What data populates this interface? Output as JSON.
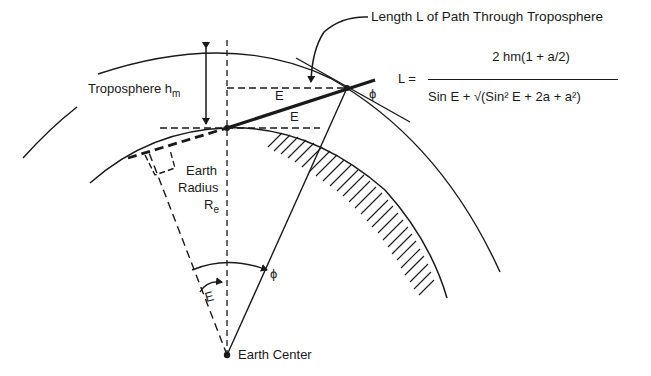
{
  "diagram": {
    "title_callout": "Length L of Path Through Troposphere",
    "labels": {
      "troposphere": "Troposphere h",
      "troposphere_sub": "m",
      "earth_radius_line1": "Earth",
      "earth_radius_line2": "Radius",
      "earth_radius_line3": "R",
      "earth_radius_sub": "e",
      "earth_center": "Earth Center",
      "elevation_upper": "E",
      "elevation_lower": "E",
      "elevation_center": "E",
      "phi_top": "ϕ",
      "phi_center": "ϕ"
    },
    "formula": {
      "lhs": "L =",
      "numerator": "2 hm(1 + a/2)",
      "denominator": "Sin E + √(Sin² E + 2a + a²)"
    },
    "colors": {
      "ink": "#1a1a1a",
      "background": "#ffffff"
    }
  }
}
